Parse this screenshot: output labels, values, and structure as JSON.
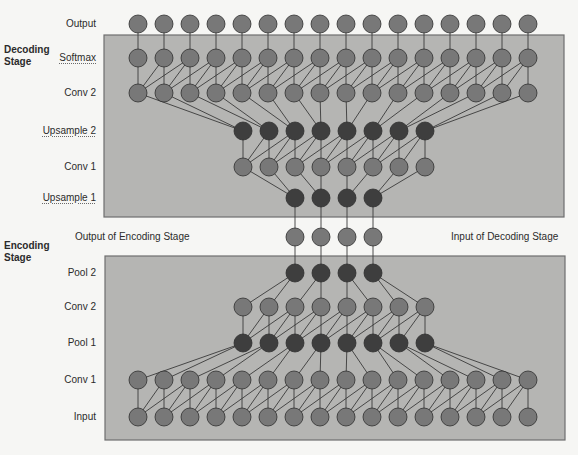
{
  "colors": {
    "background": "#f6f6f4",
    "box_fill": "#b5b5b3",
    "box_stroke": "#6e6e6e",
    "node_light": "#787878",
    "node_dark": "#3e3e3e",
    "node_stroke": "#2e2e2e",
    "edge": "#3a3a3a"
  },
  "stages": {
    "decoding": {
      "line1": "Decoding",
      "line2": "Stage"
    },
    "encoding": {
      "line1": "Encoding",
      "line2": "Stage"
    }
  },
  "annotations": {
    "output_of_encoding": "Output of Encoding Stage",
    "input_of_decoding": "Input of Decoding Stage"
  },
  "boxes": [
    {
      "name": "decoding-stage-box",
      "x": 104,
      "y": 35,
      "w": 460,
      "h": 182
    },
    {
      "name": "encoding-stage-box",
      "x": 105,
      "y": 256,
      "w": 460,
      "h": 184
    }
  ],
  "layers": [
    {
      "id": "dec_output",
      "label": "Output",
      "y": 24,
      "count": 16,
      "x0": 138,
      "dark": false,
      "squiggle": false
    },
    {
      "id": "dec_softmax",
      "label": "Softmax",
      "y": 58,
      "count": 16,
      "x0": 138,
      "dark": false,
      "squiggle": true
    },
    {
      "id": "dec_conv2",
      "label": "Conv 2",
      "y": 93,
      "count": 16,
      "x0": 138,
      "dark": false,
      "squiggle": false
    },
    {
      "id": "dec_upsample2",
      "label": "Upsample 2",
      "y": 131,
      "count": 8,
      "x0": 243,
      "dark": true,
      "squiggle": true
    },
    {
      "id": "dec_conv1",
      "label": "Conv 1",
      "y": 167,
      "count": 8,
      "x0": 243,
      "dark": false,
      "squiggle": false
    },
    {
      "id": "dec_upsample1",
      "label": "Upsample 1",
      "y": 198,
      "count": 4,
      "x0": 295,
      "dark": true,
      "squiggle": true
    },
    {
      "id": "bottleneck",
      "label": "",
      "y": 237,
      "count": 4,
      "x0": 295,
      "dark": false,
      "squiggle": false
    },
    {
      "id": "enc_pool2",
      "label": "Pool 2",
      "y": 273,
      "count": 4,
      "x0": 295,
      "dark": true,
      "squiggle": false
    },
    {
      "id": "enc_conv2",
      "label": "Conv 2",
      "y": 307,
      "count": 8,
      "x0": 243,
      "dark": false,
      "squiggle": false
    },
    {
      "id": "enc_pool1",
      "label": "Pool 1",
      "y": 343,
      "count": 8,
      "x0": 243,
      "dark": true,
      "squiggle": false
    },
    {
      "id": "enc_conv1",
      "label": "Conv 1",
      "y": 380,
      "count": 16,
      "x0": 138,
      "dark": false,
      "squiggle": false
    },
    {
      "id": "enc_input",
      "label": "Input",
      "y": 417,
      "count": 16,
      "x0": 138,
      "dark": false,
      "squiggle": false
    }
  ],
  "node": {
    "spacing": 26,
    "radius": 9
  },
  "connections": [
    {
      "upper": "dec_output",
      "lower": "dec_softmax",
      "type": "identity"
    },
    {
      "upper": "dec_softmax",
      "lower": "dec_conv2",
      "type": "conv3"
    },
    {
      "upper": "dec_conv2",
      "lower": "dec_upsample2",
      "type": "pair"
    },
    {
      "upper": "dec_upsample2",
      "lower": "dec_conv1",
      "type": "conv3"
    },
    {
      "upper": "dec_conv1",
      "lower": "dec_upsample1",
      "type": "pair"
    },
    {
      "upper": "dec_upsample1",
      "lower": "bottleneck",
      "type": "identity"
    },
    {
      "upper": "bottleneck",
      "lower": "enc_pool2",
      "type": "identity"
    },
    {
      "upper": "enc_pool2",
      "lower": "enc_conv2",
      "type": "pool"
    },
    {
      "upper": "enc_conv2",
      "lower": "enc_pool1",
      "type": "conv3"
    },
    {
      "upper": "enc_pool1",
      "lower": "enc_conv1",
      "type": "pool"
    },
    {
      "upper": "enc_conv1",
      "lower": "enc_input",
      "type": "conv3"
    }
  ]
}
